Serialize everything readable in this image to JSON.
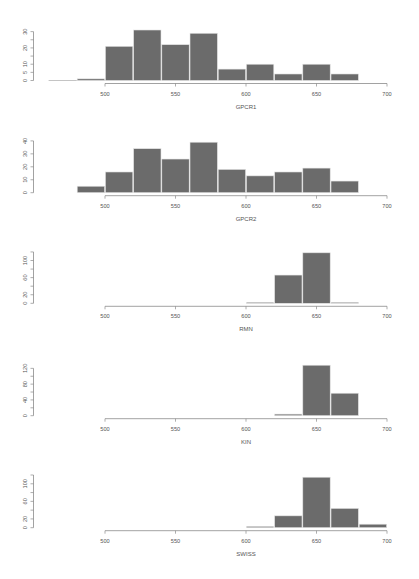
{
  "style": {
    "bar_fill": "#6b6b6b",
    "bar_border": "#e4e4e4",
    "empty_bin": "#bdbdbd",
    "axis_color": "#8a8a8a",
    "text_color": "#555555",
    "background": "#ffffff"
  },
  "chart_data": [
    {
      "type": "bar",
      "subtype": "histogram",
      "title": "",
      "xlabel": "GPCR1",
      "ylabel": "",
      "bin_start": 460,
      "bin_width": 20,
      "bin_edges": [
        460,
        480,
        500,
        520,
        540,
        560,
        580,
        600,
        620,
        640,
        660,
        680
      ],
      "values": [
        0,
        1,
        21,
        31,
        22,
        29,
        7,
        10,
        4,
        10,
        4
      ],
      "xlim": [
        500,
        700
      ],
      "xticks": [
        500,
        550,
        600,
        650,
        700
      ],
      "xtick_labels": [
        "500",
        "550",
        "600",
        "650",
        "700"
      ],
      "yticks": [
        0,
        5,
        10,
        15,
        20,
        25,
        30
      ],
      "ytick_labels": [
        "0",
        "5",
        "10",
        "",
        "20",
        "",
        "30"
      ],
      "ylim": [
        0,
        30
      ],
      "grid": false,
      "legend": null
    },
    {
      "type": "bar",
      "subtype": "histogram",
      "title": "",
      "xlabel": "GPCR2",
      "ylabel": "",
      "bin_start": 480,
      "bin_width": 20,
      "bin_edges": [
        480,
        500,
        520,
        540,
        560,
        580,
        600,
        620,
        640,
        660,
        680
      ],
      "values": [
        5,
        16,
        34,
        26,
        39,
        18,
        13,
        16,
        19,
        9
      ],
      "xlim": [
        500,
        700
      ],
      "xticks": [
        500,
        550,
        600,
        650,
        700
      ],
      "xtick_labels": [
        "500",
        "550",
        "600",
        "650",
        "700"
      ],
      "yticks": [
        0,
        10,
        20,
        30,
        40
      ],
      "ytick_labels": [
        "0",
        "10",
        "20",
        "30",
        "40"
      ],
      "ylim": [
        0,
        40
      ],
      "grid": false,
      "legend": null
    },
    {
      "type": "bar",
      "subtype": "histogram",
      "title": "",
      "xlabel": "RMN",
      "ylabel": "",
      "bin_start": 600,
      "bin_width": 20,
      "bin_edges": [
        600,
        620,
        640,
        660,
        680
      ],
      "values": [
        2,
        66,
        118,
        2
      ],
      "xlim": [
        500,
        700
      ],
      "xticks": [
        500,
        550,
        600,
        650,
        700
      ],
      "xtick_labels": [
        "500",
        "550",
        "600",
        "650",
        "700"
      ],
      "yticks": [
        0,
        20,
        40,
        60,
        80,
        100,
        120
      ],
      "ytick_labels": [
        "0",
        "20",
        "",
        "60",
        "",
        "100",
        ""
      ],
      "ylim": [
        0,
        120
      ],
      "grid": false,
      "legend": null
    },
    {
      "type": "bar",
      "subtype": "histogram",
      "title": "",
      "xlabel": "KIN",
      "ylabel": "",
      "bin_start": 620,
      "bin_width": 20,
      "bin_edges": [
        620,
        640,
        660,
        680
      ],
      "values": [
        4,
        128,
        57
      ],
      "xlim": [
        500,
        700
      ],
      "xticks": [
        500,
        550,
        600,
        650,
        700
      ],
      "xtick_labels": [
        "500",
        "550",
        "600",
        "650",
        "700"
      ],
      "yticks": [
        0,
        20,
        40,
        60,
        80,
        100,
        120
      ],
      "ytick_labels": [
        "0",
        "",
        "40",
        "",
        "80",
        "",
        "120"
      ],
      "ylim": [
        0,
        120
      ],
      "grid": false,
      "legend": null
    },
    {
      "type": "bar",
      "subtype": "histogram",
      "title": "",
      "xlabel": "SWISS",
      "ylabel": "",
      "bin_start": 600,
      "bin_width": 20,
      "bin_edges": [
        600,
        620,
        640,
        660,
        680,
        700
      ],
      "values": [
        3,
        27,
        115,
        44,
        8
      ],
      "xlim": [
        500,
        700
      ],
      "xticks": [
        500,
        550,
        600,
        650,
        700
      ],
      "xtick_labels": [
        "500",
        "550",
        "600",
        "650",
        "700"
      ],
      "yticks": [
        0,
        20,
        40,
        60,
        80,
        100,
        120
      ],
      "ytick_labels": [
        "0",
        "20",
        "",
        "60",
        "",
        "100",
        ""
      ],
      "ylim": [
        0,
        120
      ],
      "grid": false,
      "legend": null
    }
  ]
}
